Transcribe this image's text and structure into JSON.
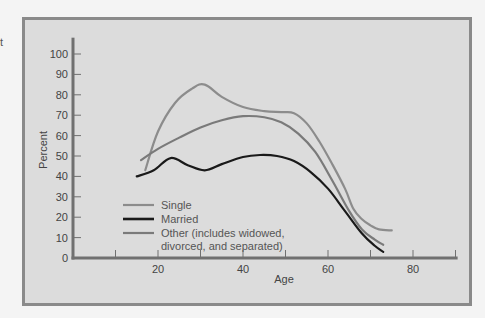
{
  "stray_text": "t",
  "chart_data": {
    "type": "line",
    "title": "",
    "xlabel": "Age",
    "ylabel": "Percent",
    "xlim": [
      0,
      90
    ],
    "ylim": [
      0,
      105
    ],
    "grid": false,
    "x_ticks": [
      10,
      20,
      30,
      40,
      50,
      60,
      70,
      80,
      90
    ],
    "x_tick_labels": [
      "",
      "20",
      "",
      "40",
      "",
      "60",
      "",
      "80",
      ""
    ],
    "y_ticks": [
      0,
      10,
      20,
      30,
      40,
      50,
      60,
      70,
      80,
      90,
      100
    ],
    "y_tick_labels": [
      "0",
      "10",
      "20",
      "30",
      "40",
      "50",
      "60",
      "70",
      "80",
      "90",
      "100"
    ],
    "legend_position": "lower-left inside plot",
    "series": [
      {
        "name": "Single",
        "color": "#8c8c8c",
        "width": 2.2,
        "x": [
          17,
          20,
          24,
          28,
          31,
          35,
          40,
          45,
          49,
          52,
          55,
          58,
          61,
          64,
          66,
          68,
          70,
          72,
          75
        ],
        "y": [
          43,
          62,
          76,
          83,
          85,
          79,
          74,
          72,
          71.5,
          71,
          66,
          57,
          46,
          34,
          24,
          19,
          16,
          14,
          13.5
        ]
      },
      {
        "name": "Married",
        "color": "#1a1a1a",
        "width": 2.2,
        "x": [
          15,
          19,
          23,
          27,
          31,
          35,
          40,
          44,
          48,
          52,
          56,
          60,
          64,
          68,
          71,
          73
        ],
        "y": [
          40,
          43,
          49,
          45.5,
          43,
          46,
          49.5,
          50.5,
          50,
          47.5,
          42,
          34,
          23,
          12,
          6,
          3
        ]
      },
      {
        "name": "Other (includes widowed, divorced, and separated)",
        "color": "#7a7a7a",
        "width": 2.2,
        "x": [
          16,
          20,
          25,
          30,
          35,
          40,
          45,
          49,
          53,
          57,
          61,
          65,
          68,
          71,
          73
        ],
        "y": [
          48,
          53.5,
          59,
          64,
          67.5,
          69.5,
          69,
          66.5,
          61,
          52,
          38,
          23,
          14,
          9,
          6.5
        ]
      }
    ]
  },
  "legend": {
    "items": [
      {
        "label": "Single"
      },
      {
        "label": "Married"
      },
      {
        "label_line1": "Other (includes widowed,",
        "label_line2": "divorced, and separated)"
      }
    ]
  }
}
